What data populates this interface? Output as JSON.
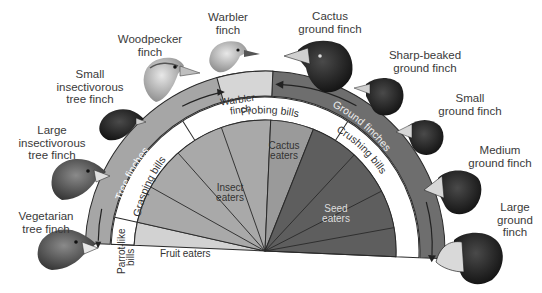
{
  "diagram": {
    "colors": {
      "outer_band_tree": "#a6a6a6",
      "outer_band_ground": "#6e6e6e",
      "warbler_box": "#d6d6d6",
      "bill_ring": "#ffffff",
      "fruit_wedge": "#d2d2d2",
      "insect_wedge": "#a9a9a9",
      "cactus_wedge": "#9a9a9a",
      "seed_wedge": "#5e5e5e",
      "lines": "#2a2a2a"
    },
    "outer_band": {
      "tree_finches": "Tree finches",
      "ground_finches": "Ground finches",
      "warbler_box_line1": "Warbler",
      "warbler_box_line2": "finch"
    },
    "bill_ring": {
      "parrot_line1": "Parrot-like",
      "parrot_line2": "bills",
      "grasping": "Grasping bills",
      "probing": "Probing bills",
      "crushing": "Crushing bills"
    },
    "diet_wedges": {
      "fruit": "Fruit eaters",
      "insect_line1": "Insect",
      "insect_line2": "eaters",
      "cactus_line1": "Cactus",
      "cactus_line2": "eaters",
      "seed_line1": "Seed",
      "seed_line2": "eaters"
    },
    "finches": [
      {
        "line1": "Vegetarian",
        "line2": "tree finch",
        "icon": "finch-head-icon"
      },
      {
        "line1": "Large",
        "line2": "insectivorous",
        "line3": "tree finch",
        "icon": "finch-head-icon"
      },
      {
        "line1": "Small",
        "line2": "insectivorous",
        "line3": "tree finch",
        "icon": "finch-head-icon"
      },
      {
        "line1": "Woodpecker",
        "line2": "finch",
        "icon": "finch-head-icon"
      },
      {
        "line1": "Warbler",
        "line2": "finch",
        "icon": "finch-head-icon"
      },
      {
        "line1": "Cactus",
        "line2": "ground finch",
        "icon": "finch-head-icon"
      },
      {
        "line1": "Sharp-beaked",
        "line2": "ground finch",
        "icon": "finch-head-icon"
      },
      {
        "line1": "Small",
        "line2": "ground finch",
        "icon": "finch-head-icon"
      },
      {
        "line1": "Medium",
        "line2": "ground finch",
        "icon": "finch-head-icon"
      },
      {
        "line1": "Large",
        "line2": "ground",
        "line3": "finch",
        "icon": "finch-head-icon"
      }
    ]
  }
}
